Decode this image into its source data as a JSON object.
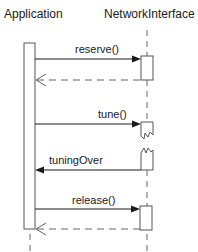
{
  "diagram": {
    "type": "sequence",
    "participants": [
      {
        "id": "application",
        "label": "Application"
      },
      {
        "id": "network",
        "label": "NetworkInterface"
      }
    ],
    "messages": [
      {
        "label": "reserve()",
        "from": "Application",
        "to": "NetworkInterface",
        "kind": "synchronous"
      },
      {
        "label": "",
        "from": "NetworkInterface",
        "to": "Application",
        "kind": "return"
      },
      {
        "label": "tune()",
        "from": "Application",
        "to": "NetworkInterface",
        "kind": "asynchronous-start"
      },
      {
        "label": "tuningOver",
        "from": "NetworkInterface",
        "to": "Application",
        "kind": "asynchronous-callback"
      },
      {
        "label": "release()",
        "from": "Application",
        "to": "NetworkInterface",
        "kind": "synchronous"
      },
      {
        "label": "",
        "from": "NetworkInterface",
        "to": "Application",
        "kind": "return"
      }
    ],
    "colors": {
      "line": "#1a1a1a",
      "dashed": "#555555",
      "box_stroke": "#555555"
    }
  }
}
